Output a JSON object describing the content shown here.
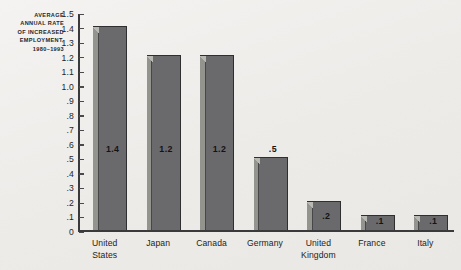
{
  "chart_data": {
    "type": "bar",
    "title_lines": [
      "AVERAGE",
      "ANNUAL RATE",
      "OF INCREASED",
      "EMPLOYMENT,",
      "1980–1993"
    ],
    "categories": [
      "United States",
      "Japan",
      "Canada",
      "Germany",
      "United Kingdom",
      "France",
      "Italy"
    ],
    "category_lines": [
      [
        "United",
        "States"
      ],
      [
        "Japan"
      ],
      [
        "Canada"
      ],
      [
        "Germany"
      ],
      [
        "United",
        "Kingdom"
      ],
      [
        "France"
      ],
      [
        "Italy"
      ]
    ],
    "values": [
      1.4,
      1.2,
      1.2,
      0.5,
      0.2,
      0.1,
      0.1
    ],
    "value_labels": [
      "1.4",
      "1.2",
      "1.2",
      ".5",
      ".2",
      ".1",
      ".1"
    ],
    "xlabel": "",
    "ylabel": "",
    "ylim": [
      0,
      1.5
    ],
    "ytick_step": 0.1,
    "ytick_labels": [
      "0",
      ".1",
      ".2",
      ".3",
      ".4",
      ".5",
      ".6",
      ".7",
      ".8",
      ".9",
      "1.0",
      "1.1",
      "1.2",
      "1.3",
      "1.4",
      "1.5"
    ],
    "ytick_values": [
      0,
      0.1,
      0.2,
      0.3,
      0.4,
      0.5,
      0.6,
      0.7,
      0.8,
      0.9,
      1.0,
      1.1,
      1.2,
      1.3,
      1.4,
      1.5
    ],
    "grid": false,
    "legend": false,
    "legend_position": "none",
    "colors": {
      "background": "#eeedea",
      "bar_face": "#6a6a6d",
      "bar_bevel": "#94948f",
      "bar_outline": "#2f2f31",
      "axis": "#3a3a3c",
      "text": "#1d1d20"
    }
  }
}
